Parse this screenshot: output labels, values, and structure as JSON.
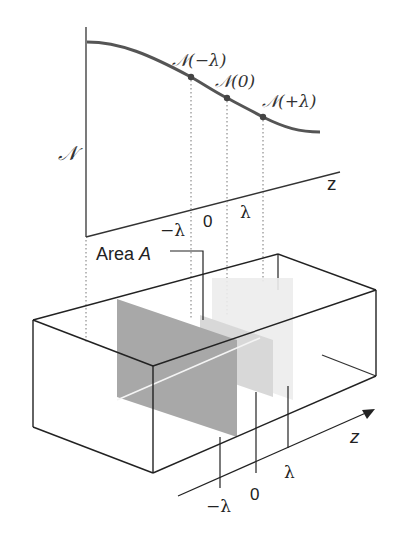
{
  "figure": {
    "colors": {
      "line": "#2a2a2a",
      "curve": "#555555",
      "plane_minus": "#a9a9a9",
      "plane_zero": "#d8d8d8",
      "plane_plus": "#ededed",
      "dots": "#7a7a7a"
    },
    "graph": {
      "y_label": "𝒩",
      "x_label": "z",
      "ticks": [
        "−λ",
        "0",
        "λ"
      ],
      "points": [
        {
          "label": "𝒩(−λ)"
        },
        {
          "label": "𝒩(0)"
        },
        {
          "label": "𝒩(+λ)"
        }
      ]
    },
    "box": {
      "area_label": "Area A",
      "area_label_plain": "Area ",
      "area_label_var": "A",
      "axis_label": "z",
      "ticks": [
        "−λ",
        "0",
        "λ"
      ]
    }
  }
}
